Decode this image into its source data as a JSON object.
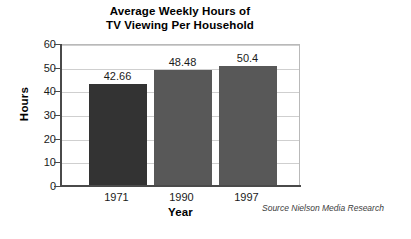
{
  "chart_data": {
    "type": "bar",
    "title": "Average Weekly Hours of TV Viewing Per Household",
    "title_lines": [
      "Average Weekly Hours of",
      "TV Viewing Per Household"
    ],
    "categories": [
      "1971",
      "1990",
      "1997"
    ],
    "values": [
      42.66,
      48.48,
      50.4
    ],
    "value_labels": [
      "42.66",
      "48.48",
      "50.4"
    ],
    "xlabel": "Year",
    "ylabel": "Hours",
    "ylim": [
      0,
      60
    ],
    "ytick_step": 10,
    "ytick_labels": [
      "60",
      "50",
      "40",
      "30",
      "20",
      "10",
      "0"
    ],
    "grid": true,
    "legend": "none",
    "annotations": [
      "Source Nielson Media Research"
    ],
    "bar_colors": [
      "#333333",
      "#585858",
      "#585858"
    ],
    "plot_border_color": "#b9b9b9",
    "gridline_color": "#cfcfcf",
    "axis_color": "#4a4a4a",
    "background_color": "#ffffff"
  },
  "source": {
    "note": "Source Nielson Media Research"
  }
}
